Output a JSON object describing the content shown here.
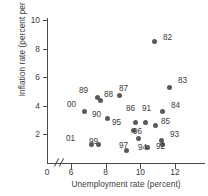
{
  "chart_data": {
    "type": "scatter",
    "title": "",
    "xlabel": "Unemployment rate (percent)",
    "ylabel": "Inflation rate (percent per year)",
    "xlim": [
      5.5,
      12.6
    ],
    "ylim": [
      0,
      10.8
    ],
    "xticks": [
      6,
      8,
      10,
      12
    ],
    "yticks": [
      2,
      4,
      6,
      8,
      10
    ],
    "x_origin_label": "0",
    "axis_break": true,
    "grid": false,
    "legend": false,
    "point_color": "#5a5a5a",
    "axis_color": "#4a4a4a",
    "text_color": "#3a3a3a",
    "points": [
      {
        "label": "82",
        "x": 10.8,
        "y": 8.5,
        "lx": 163,
        "ly": 33
      },
      {
        "label": "83",
        "x": 11.7,
        "y": 5.3,
        "lx": 178,
        "ly": 76
      },
      {
        "label": "87",
        "x": 8.8,
        "y": 4.7,
        "lx": 119,
        "ly": 84
      },
      {
        "label": "89",
        "x": 7.5,
        "y": 4.6,
        "lx": 79,
        "ly": 86
      },
      {
        "label": "88",
        "x": 7.7,
        "y": 4.4,
        "lx": 104,
        "ly": 90
      },
      {
        "label": "00",
        "x": 6.8,
        "y": 3.6,
        "lx": 67,
        "ly": 100
      },
      {
        "label": "84",
        "x": 11.3,
        "y": 3.6,
        "lx": 171,
        "ly": 101
      },
      {
        "label": "90",
        "x": 8.1,
        "y": 3.1,
        "lx": 92,
        "ly": 110
      },
      {
        "label": "86",
        "x": 9.7,
        "y": 2.8,
        "lx": 126,
        "ly": 104
      },
      {
        "label": "91",
        "x": 10.3,
        "y": 2.8,
        "lx": 142,
        "ly": 104
      },
      {
        "label": "85",
        "x": 10.9,
        "y": 2.6,
        "lx": 161,
        "ly": 117
      },
      {
        "label": "95",
        "x": 9.6,
        "y": 2.3,
        "lx": 112,
        "ly": 118
      },
      {
        "label": "96",
        "x": 9.9,
        "y": 1.7,
        "lx": 133,
        "ly": 127
      },
      {
        "label": "93",
        "x": 11.2,
        "y": 1.6,
        "lx": 170,
        "ly": 130
      },
      {
        "label": "99",
        "x": 7.6,
        "y": 1.3,
        "lx": 89,
        "ly": 137
      },
      {
        "label": "01",
        "x": 7.2,
        "y": 1.3,
        "lx": 66,
        "ly": 134
      },
      {
        "label": "92",
        "x": 11.3,
        "y": 1.3,
        "lx": 156,
        "ly": 142
      },
      {
        "label": "94",
        "x": 10.4,
        "y": 1.1,
        "lx": 138,
        "ly": 143
      },
      {
        "label": "97",
        "x": 9.2,
        "y": 0.9,
        "lx": 119,
        "ly": 141
      }
    ]
  }
}
